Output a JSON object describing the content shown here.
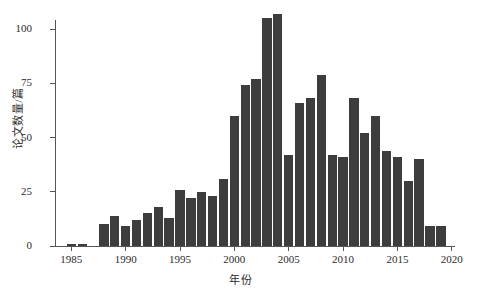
{
  "chart_data": {
    "type": "bar",
    "title": "",
    "xlabel": "年份",
    "ylabel": "论文数量/篇",
    "xlim": [
      1983.5,
      2020.3
    ],
    "ylim": [
      0,
      112
    ],
    "grid": false,
    "legend": null,
    "bar_color": "#3d3d3d",
    "axis_color": "#555555",
    "xticks": [
      1985,
      1990,
      1995,
      2000,
      2005,
      2010,
      2015,
      2020
    ],
    "xtick_labels": [
      "1985",
      "1990",
      "1995",
      "2000",
      "2005",
      "2010",
      "2015",
      "2020"
    ],
    "yticks": [
      0,
      25,
      50,
      75,
      100
    ],
    "ytick_labels": [
      "0",
      "25",
      "50",
      "75",
      "100"
    ],
    "categories": [
      1985,
      1986,
      1988,
      1989,
      1990,
      1991,
      1992,
      1993,
      1994,
      1995,
      1996,
      1997,
      1998,
      1999,
      2000,
      2001,
      2002,
      2003,
      2004,
      2005,
      2006,
      2007,
      2008,
      2009,
      2010,
      2011,
      2012,
      2013,
      2014,
      2015,
      2016,
      2017,
      2018,
      2019
    ],
    "values": [
      1,
      1,
      10,
      14,
      9,
      12,
      15,
      18,
      13,
      26,
      22,
      25,
      23,
      31,
      60,
      74,
      77,
      105,
      107,
      42,
      66,
      68,
      79,
      42,
      41,
      68,
      52,
      60,
      44,
      41,
      30,
      40,
      9,
      9
    ],
    "points": [
      {
        "year": 1985,
        "value": 1
      },
      {
        "year": 1986,
        "value": 1
      },
      {
        "year": 1988,
        "value": 10
      },
      {
        "year": 1989,
        "value": 14
      },
      {
        "year": 1990,
        "value": 9
      },
      {
        "year": 1991,
        "value": 12
      },
      {
        "year": 1992,
        "value": 15
      },
      {
        "year": 1993,
        "value": 18
      },
      {
        "year": 1994,
        "value": 13
      },
      {
        "year": 1995,
        "value": 26
      },
      {
        "year": 1996,
        "value": 22
      },
      {
        "year": 1997,
        "value": 25
      },
      {
        "year": 1998,
        "value": 23
      },
      {
        "year": 1999,
        "value": 31
      },
      {
        "year": 2000,
        "value": 60
      },
      {
        "year": 2001,
        "value": 74
      },
      {
        "year": 2002,
        "value": 77
      },
      {
        "year": 2003,
        "value": 105
      },
      {
        "year": 2004,
        "value": 107
      },
      {
        "year": 2005,
        "value": 42
      },
      {
        "year": 2006,
        "value": 66
      },
      {
        "year": 2007,
        "value": 68
      },
      {
        "year": 2008,
        "value": 79
      },
      {
        "year": 2009,
        "value": 42
      },
      {
        "year": 2010,
        "value": 41
      },
      {
        "year": 2011,
        "value": 68
      },
      {
        "year": 2012,
        "value": 52
      },
      {
        "year": 2013,
        "value": 60
      },
      {
        "year": 2014,
        "value": 44
      },
      {
        "year": 2015,
        "value": 41
      },
      {
        "year": 2016,
        "value": 30
      },
      {
        "year": 2017,
        "value": 40
      },
      {
        "year": 2018,
        "value": 9
      },
      {
        "year": 2019,
        "value": 9
      }
    ]
  }
}
